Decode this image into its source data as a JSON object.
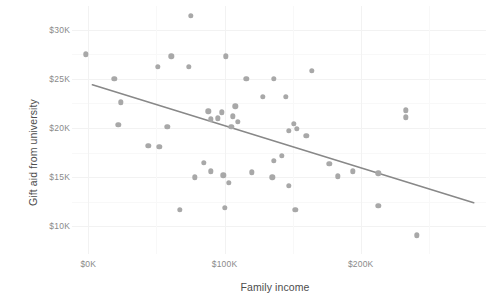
{
  "chart_data": {
    "type": "scatter",
    "title": "",
    "xlabel": "Family income",
    "ylabel": "Gift aid from university",
    "xlim": [
      -12,
      292
    ],
    "ylim": [
      7200,
      32400
    ],
    "xticks": [
      0,
      100000,
      200000
    ],
    "xtick_labels": [
      "$0K",
      "$100K",
      "$200K"
    ],
    "yticks": [
      10000,
      15000,
      20000,
      25000,
      30000
    ],
    "ytick_labels": [
      "$10K",
      "$15K",
      "$20K",
      "$25K",
      "$30K"
    ],
    "x_minor_ticks": [
      50000,
      150000,
      250000
    ],
    "y_minor_ticks": [
      12500,
      17500,
      22500,
      27500,
      32500
    ],
    "grid": true,
    "legend": "none",
    "point_color": "#a8a8a8",
    "trend_color": "#888888",
    "grid_color": "#f2f2f2",
    "panel_background": "#ffffff",
    "axis_text_color": "#8a8a8a",
    "axis_title_color": "#4d4d4d",
    "points": [
      {
        "x": 75,
        "y": 31400
      },
      {
        "x": -2,
        "y": 27500
      },
      {
        "x": 51,
        "y": 26200
      },
      {
        "x": 61,
        "y": 27300
      },
      {
        "x": 19,
        "y": 25000
      },
      {
        "x": 101,
        "y": 27300
      },
      {
        "x": 74,
        "y": 26200
      },
      {
        "x": 116,
        "y": 25000
      },
      {
        "x": 164,
        "y": 25800
      },
      {
        "x": 136,
        "y": 25000
      },
      {
        "x": 128,
        "y": 23200
      },
      {
        "x": 145,
        "y": 23200
      },
      {
        "x": 24,
        "y": 22600
      },
      {
        "x": 88,
        "y": 21700
      },
      {
        "x": 98,
        "y": 21600
      },
      {
        "x": 106,
        "y": 21200
      },
      {
        "x": 233,
        "y": 21800
      },
      {
        "x": 95,
        "y": 21000
      },
      {
        "x": 110,
        "y": 20600
      },
      {
        "x": 105,
        "y": 20100
      },
      {
        "x": 233,
        "y": 21100
      },
      {
        "x": 22,
        "y": 20300
      },
      {
        "x": 58,
        "y": 20100
      },
      {
        "x": 151,
        "y": 20400
      },
      {
        "x": 153,
        "y": 19900
      },
      {
        "x": 147,
        "y": 19700
      },
      {
        "x": 160,
        "y": 19200
      },
      {
        "x": 44,
        "y": 18200
      },
      {
        "x": 52,
        "y": 18100
      },
      {
        "x": 142,
        "y": 17200
      },
      {
        "x": 85,
        "y": 16500
      },
      {
        "x": 136,
        "y": 16700
      },
      {
        "x": 177,
        "y": 16400
      },
      {
        "x": 90,
        "y": 15600
      },
      {
        "x": 194,
        "y": 15600
      },
      {
        "x": 120,
        "y": 15500
      },
      {
        "x": 99,
        "y": 15200
      },
      {
        "x": 135,
        "y": 15000
      },
      {
        "x": 213,
        "y": 15400
      },
      {
        "x": 183,
        "y": 15100
      },
      {
        "x": 78,
        "y": 15000
      },
      {
        "x": 103,
        "y": 14400
      },
      {
        "x": 147,
        "y": 14100
      },
      {
        "x": 100,
        "y": 11900
      },
      {
        "x": 67,
        "y": 11700
      },
      {
        "x": 152,
        "y": 11700
      },
      {
        "x": 213,
        "y": 12100
      },
      {
        "x": 241,
        "y": 9100
      },
      {
        "x": 108,
        "y": 22200
      },
      {
        "x": 90,
        "y": 20900
      }
    ],
    "trend_line": {
      "type": "linear_fit",
      "x_start": 3,
      "y_start": 24400,
      "x_end": 283,
      "y_end": 12400
    }
  }
}
